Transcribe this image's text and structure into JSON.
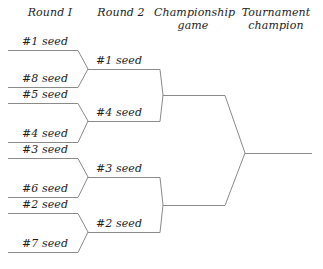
{
  "diagram": {
    "line_color": "#8a8a8a",
    "text_color": "#1d1d1d"
  },
  "headers": [
    {
      "name": "round-1",
      "label": "Round I"
    },
    {
      "name": "round-2",
      "label": "Round 2"
    },
    {
      "name": "championship-game",
      "label": "Championship\ngame"
    },
    {
      "name": "tournament-champion",
      "label": "Tournament\nchampion"
    }
  ],
  "rounds": {
    "round1": {
      "label": "Round I",
      "slots": [
        {
          "label": "#1 seed",
          "seed": 1
        },
        {
          "label": "#8 seed",
          "seed": 8
        },
        {
          "label": "#5 seed",
          "seed": 5
        },
        {
          "label": "#4 seed",
          "seed": 4
        },
        {
          "label": "#3 seed",
          "seed": 3
        },
        {
          "label": "#6 seed",
          "seed": 6
        },
        {
          "label": "#2 seed",
          "seed": 2
        },
        {
          "label": "#7 seed",
          "seed": 7
        }
      ]
    },
    "round2": {
      "label": "Round 2",
      "slots": [
        {
          "label": "#1 seed",
          "seed": 1
        },
        {
          "label": "#4 seed",
          "seed": 4
        },
        {
          "label": "#3 seed",
          "seed": 3
        },
        {
          "label": "#2 seed",
          "seed": 2
        }
      ]
    },
    "championship": {
      "label": "Championship game",
      "slots": []
    },
    "champion": {
      "label": "Tournament champion",
      "slots": []
    }
  },
  "matchups": {
    "round1": [
      {
        "top": "#1 seed",
        "bottom": "#8 seed",
        "winner": "#1 seed"
      },
      {
        "top": "#5 seed",
        "bottom": "#4 seed",
        "winner": "#4 seed"
      },
      {
        "top": "#3 seed",
        "bottom": "#6 seed",
        "winner": "#3 seed"
      },
      {
        "top": "#2 seed",
        "bottom": "#7 seed",
        "winner": "#2 seed"
      }
    ],
    "round2": [
      {
        "top": "#1 seed",
        "bottom": "#4 seed",
        "winner": ""
      },
      {
        "top": "#3 seed",
        "bottom": "#2 seed",
        "winner": ""
      }
    ]
  }
}
